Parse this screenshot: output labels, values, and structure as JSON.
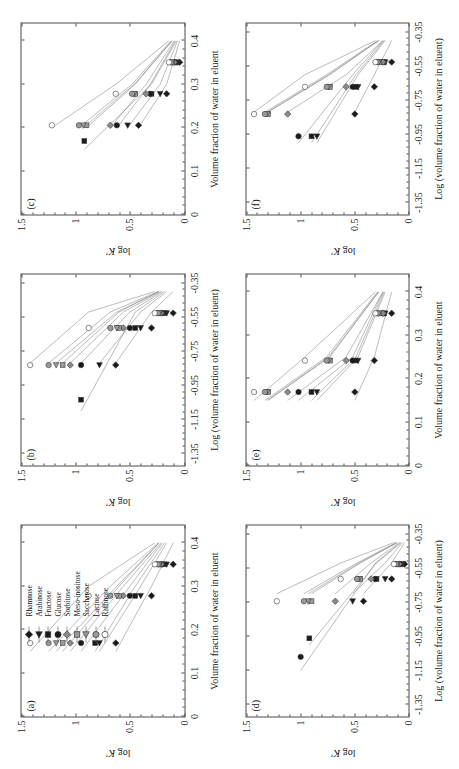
{
  "figure": {
    "ylabel": "log K'",
    "xlabel_linear": "Volume fraction of water in eluent",
    "xlabel_log": "Log (volume fraction of water in eluent)"
  },
  "legend": {
    "title": "",
    "items": [
      {
        "label": "Rhamnose",
        "marker": "diamond",
        "fill": "#1a1a1a"
      },
      {
        "label": "Arabinose",
        "marker": "triangle",
        "fill": "#1a1a1a"
      },
      {
        "label": "Fructose",
        "marker": "square",
        "fill": "#1a1a1a"
      },
      {
        "label": "Glucose",
        "marker": "circle",
        "fill": "#1a1a1a"
      },
      {
        "label": "Sorbitose",
        "marker": "diamond",
        "fill": "#8a8a8a"
      },
      {
        "label": "Meso-inositose",
        "marker": "square",
        "fill": "#9a9a9a"
      },
      {
        "label": "Saccharose",
        "marker": "triangle",
        "fill": "#9a9a9a"
      },
      {
        "label": "Lactose",
        "marker": "circle",
        "fill": "#9a9a9a"
      },
      {
        "label": "Raffinose",
        "marker": "circle",
        "fill": "#ffffff"
      }
    ]
  },
  "axes": {
    "y_ticks": [
      "0",
      "0.5",
      "1",
      "1.5"
    ],
    "y_values": [
      0,
      0.5,
      1,
      1.5
    ],
    "y_range": [
      0,
      1.5
    ],
    "x_ticks_linear": [
      "0",
      "0.1",
      "0.2",
      "0.3",
      "0.4"
    ],
    "x_values_linear": [
      0,
      0.1,
      0.2,
      0.3,
      0.4
    ],
    "x_range_linear": [
      0,
      0.44
    ],
    "x_ticks_log": [
      "-1.35",
      "-1.15",
      "-0.95",
      "-0.75",
      "-0.55",
      "-0.35"
    ],
    "x_values_log": [
      -1.35,
      -1.15,
      -0.95,
      -0.75,
      -0.55,
      -0.35
    ],
    "x_range_log": [
      -1.42,
      -0.3
    ]
  },
  "chart_data": [
    {
      "type": "scatter",
      "panel": "(a)",
      "title": "",
      "xlabel": "Volume fraction of water in eluent",
      "ylabel": "log K'",
      "xlim": [
        0,
        0.44
      ],
      "ylim": [
        0,
        1.5
      ],
      "grid": false,
      "legend_position": "inside-top-left",
      "series": [
        {
          "name": "Rhamnose",
          "marker": "diamond",
          "fill": "#1a1a1a",
          "x": [
            0.15,
            0.3,
            0.4
          ],
          "y": [
            0.63,
            0.3,
            0.1
          ]
        },
        {
          "name": "Arabinose",
          "marker": "triangle",
          "fill": "#1a1a1a",
          "x": [
            0.15,
            0.3,
            0.4
          ],
          "y": [
            0.78,
            0.4,
            0.16
          ]
        },
        {
          "name": "Fructose",
          "marker": "square",
          "fill": "#1a1a1a",
          "x": [
            0.15,
            0.3,
            0.4
          ],
          "y": [
            0.82,
            0.45,
            0.18
          ]
        },
        {
          "name": "Glucose",
          "marker": "circle",
          "fill": "#1a1a1a",
          "x": [
            0.15,
            0.3,
            0.4
          ],
          "y": [
            0.95,
            0.5,
            0.2
          ]
        },
        {
          "name": "Sorbitose",
          "marker": "diamond",
          "fill": "#8a8a8a",
          "x": [
            0.15,
            0.3,
            0.4
          ],
          "y": [
            1.05,
            0.56,
            0.21
          ]
        },
        {
          "name": "Meso-inositose",
          "marker": "square",
          "fill": "#9a9a9a",
          "x": [
            0.15,
            0.3,
            0.4
          ],
          "y": [
            1.12,
            0.6,
            0.23
          ]
        },
        {
          "name": "Saccharose",
          "marker": "triangle",
          "fill": "#9a9a9a",
          "x": [
            0.15,
            0.3,
            0.4
          ],
          "y": [
            1.18,
            0.62,
            0.23
          ]
        },
        {
          "name": "Lactose",
          "marker": "circle",
          "fill": "#9a9a9a",
          "x": [
            0.15,
            0.3,
            0.4
          ],
          "y": [
            1.25,
            0.68,
            0.24
          ]
        },
        {
          "name": "Raffinose",
          "marker": "circle",
          "fill": "#ffffff",
          "x": [
            0.15,
            0.3,
            0.4
          ],
          "y": [
            1.42,
            0.88,
            0.27
          ]
        }
      ]
    },
    {
      "type": "scatter",
      "panel": "(b)",
      "title": "",
      "xlabel": "Log (volume fraction of water in eluent)",
      "ylabel": "log K'",
      "xlim": [
        -1.42,
        -0.3
      ],
      "ylim": [
        0,
        1.5
      ],
      "grid": false,
      "legend_position": "none",
      "series": [
        {
          "name": "Rhamnose",
          "marker": "diamond",
          "fill": "#1a1a1a",
          "x": [
            -0.82,
            -0.52,
            -0.4
          ],
          "y": [
            0.63,
            0.3,
            0.1
          ]
        },
        {
          "name": "Arabinose",
          "marker": "triangle",
          "fill": "#1a1a1a",
          "x": [
            -0.82,
            -0.52,
            -0.4
          ],
          "y": [
            0.78,
            0.4,
            0.16
          ]
        },
        {
          "name": "Fructose",
          "marker": "square",
          "fill": "#1a1a1a",
          "x": [
            -1.1,
            -0.52,
            -0.4
          ],
          "y": [
            0.95,
            0.45,
            0.18
          ]
        },
        {
          "name": "Glucose",
          "marker": "circle",
          "fill": "#1a1a1a",
          "x": [
            -0.82,
            -0.52,
            -0.4
          ],
          "y": [
            0.95,
            0.5,
            0.2
          ]
        },
        {
          "name": "Sorbitose",
          "marker": "diamond",
          "fill": "#8a8a8a",
          "x": [
            -0.82,
            -0.52,
            -0.4
          ],
          "y": [
            1.05,
            0.56,
            0.21
          ]
        },
        {
          "name": "Meso-inositose",
          "marker": "square",
          "fill": "#9a9a9a",
          "x": [
            -0.82,
            -0.52,
            -0.4
          ],
          "y": [
            1.12,
            0.6,
            0.23
          ]
        },
        {
          "name": "Saccharose",
          "marker": "triangle",
          "fill": "#9a9a9a",
          "x": [
            -0.82,
            -0.52,
            -0.4
          ],
          "y": [
            1.18,
            0.62,
            0.23
          ]
        },
        {
          "name": "Lactose",
          "marker": "circle",
          "fill": "#9a9a9a",
          "x": [
            -0.82,
            -0.52,
            -0.4
          ],
          "y": [
            1.25,
            0.68,
            0.24
          ]
        },
        {
          "name": "Raffinose",
          "marker": "circle",
          "fill": "#ffffff",
          "x": [
            -0.82,
            -0.52,
            -0.4
          ],
          "y": [
            1.42,
            0.88,
            0.27
          ]
        }
      ]
    },
    {
      "type": "scatter",
      "panel": "(c)",
      "title": "",
      "xlabel": "Volume fraction of water in eluent",
      "ylabel": "log K'",
      "xlim": [
        0,
        0.44
      ],
      "ylim": [
        0,
        1.5
      ],
      "grid": false,
      "legend_position": "none",
      "series": [
        {
          "name": "Rhamnose",
          "marker": "diamond",
          "fill": "#1a1a1a",
          "x": [
            0.2,
            0.3,
            0.4
          ],
          "y": [
            0.42,
            0.16,
            0.04
          ]
        },
        {
          "name": "Arabinose",
          "marker": "triangle",
          "fill": "#1a1a1a",
          "x": [
            0.2,
            0.3,
            0.4
          ],
          "y": [
            0.52,
            0.22,
            0.06
          ]
        },
        {
          "name": "Fructose",
          "marker": "square",
          "fill": "#1a1a1a",
          "x": [
            0.15,
            0.3,
            0.4
          ],
          "y": [
            0.92,
            0.3,
            0.07
          ]
        },
        {
          "name": "Glucose",
          "marker": "circle",
          "fill": "#1a1a1a",
          "x": [
            0.2,
            0.3,
            0.4
          ],
          "y": [
            0.62,
            0.31,
            0.08
          ]
        },
        {
          "name": "Sorbitose",
          "marker": "diamond",
          "fill": "#8a8a8a",
          "x": [
            0.2,
            0.3,
            0.4
          ],
          "y": [
            0.68,
            0.35,
            0.09
          ]
        },
        {
          "name": "Meso-inositose",
          "marker": "square",
          "fill": "#9a9a9a",
          "x": [
            0.2,
            0.3,
            0.4
          ],
          "y": [
            0.9,
            0.45,
            0.11
          ]
        },
        {
          "name": "Saccharose",
          "marker": "triangle",
          "fill": "#9a9a9a",
          "x": [
            0.2,
            0.3,
            0.4
          ],
          "y": [
            0.93,
            0.46,
            0.11
          ]
        },
        {
          "name": "Lactose",
          "marker": "circle",
          "fill": "#9a9a9a",
          "x": [
            0.2,
            0.3,
            0.4
          ],
          "y": [
            0.97,
            0.48,
            0.12
          ]
        },
        {
          "name": "Raffinose",
          "marker": "circle",
          "fill": "#ffffff",
          "x": [
            0.2,
            0.3,
            0.4
          ],
          "y": [
            1.22,
            0.63,
            0.14
          ]
        }
      ]
    },
    {
      "type": "scatter",
      "panel": "(d)",
      "title": "",
      "xlabel": "Log (volume fraction of water in eluent)",
      "ylabel": "log K'",
      "xlim": [
        -1.42,
        -0.3
      ],
      "ylim": [
        0,
        1.5
      ],
      "grid": false,
      "legend_position": "none",
      "series": [
        {
          "name": "Rhamnose",
          "marker": "diamond",
          "fill": "#1a1a1a",
          "x": [
            -0.7,
            -0.52,
            -0.4
          ],
          "y": [
            0.42,
            0.16,
            0.04
          ]
        },
        {
          "name": "Arabinose",
          "marker": "triangle",
          "fill": "#1a1a1a",
          "x": [
            -0.7,
            -0.52,
            -0.4
          ],
          "y": [
            0.52,
            0.22,
            0.06
          ]
        },
        {
          "name": "Fructose",
          "marker": "square",
          "fill": "#1a1a1a",
          "x": [
            -1.0,
            -0.52,
            -0.4
          ],
          "y": [
            0.92,
            0.3,
            0.07
          ]
        },
        {
          "name": "Glucose",
          "marker": "circle",
          "fill": "#1a1a1a",
          "x": [
            -1.15,
            -0.52,
            -0.4
          ],
          "y": [
            1.0,
            0.31,
            0.08
          ]
        },
        {
          "name": "Sorbitose",
          "marker": "diamond",
          "fill": "#8a8a8a",
          "x": [
            -0.7,
            -0.52,
            -0.4
          ],
          "y": [
            0.68,
            0.35,
            0.09
          ]
        },
        {
          "name": "Meso-inositose",
          "marker": "square",
          "fill": "#9a9a9a",
          "x": [
            -0.7,
            -0.52,
            -0.4
          ],
          "y": [
            0.9,
            0.45,
            0.11
          ]
        },
        {
          "name": "Saccharose",
          "marker": "triangle",
          "fill": "#9a9a9a",
          "x": [
            -0.7,
            -0.52,
            -0.4
          ],
          "y": [
            0.93,
            0.46,
            0.11
          ]
        },
        {
          "name": "Lactose",
          "marker": "circle",
          "fill": "#9a9a9a",
          "x": [
            -0.7,
            -0.52,
            -0.4
          ],
          "y": [
            0.97,
            0.48,
            0.12
          ]
        },
        {
          "name": "Raffinose",
          "marker": "circle",
          "fill": "#ffffff",
          "x": [
            -0.7,
            -0.52,
            -0.4
          ],
          "y": [
            1.22,
            0.63,
            0.14
          ]
        }
      ]
    },
    {
      "type": "scatter",
      "panel": "(e)",
      "title": "",
      "xlabel": "Volume fraction of water in eluent",
      "ylabel": "log K'",
      "xlim": [
        0,
        0.44
      ],
      "ylim": [
        0,
        1.5
      ],
      "grid": false,
      "legend_position": "none",
      "series": [
        {
          "name": "Rhamnose",
          "marker": "diamond",
          "fill": "#1a1a1a",
          "x": [
            0.15,
            0.25,
            0.4
          ],
          "y": [
            0.5,
            0.32,
            0.16
          ]
        },
        {
          "name": "Arabinose",
          "marker": "triangle",
          "fill": "#1a1a1a",
          "x": [
            0.15,
            0.25,
            0.4
          ],
          "y": [
            0.85,
            0.47,
            0.22
          ]
        },
        {
          "name": "Fructose",
          "marker": "square",
          "fill": "#1a1a1a",
          "x": [
            0.15,
            0.25,
            0.4
          ],
          "y": [
            0.9,
            0.49,
            0.23
          ]
        },
        {
          "name": "Glucose",
          "marker": "circle",
          "fill": "#1a1a1a",
          "x": [
            0.15,
            0.25,
            0.4
          ],
          "y": [
            1.02,
            0.52,
            0.24
          ]
        },
        {
          "name": "Sorbitose",
          "marker": "diamond",
          "fill": "#8a8a8a",
          "x": [
            0.15,
            0.25,
            0.4
          ],
          "y": [
            1.12,
            0.58,
            0.24
          ]
        },
        {
          "name": "Meso-inositose",
          "marker": "square",
          "fill": "#9a9a9a",
          "x": [
            0.15,
            0.25,
            0.4
          ],
          "y": [
            1.3,
            0.73,
            0.28
          ]
        },
        {
          "name": "Saccharose",
          "marker": "triangle",
          "fill": "#9a9a9a",
          "x": [
            0.15,
            0.25,
            0.4
          ],
          "y": [
            1.31,
            0.74,
            0.28
          ]
        },
        {
          "name": "Lactose",
          "marker": "circle",
          "fill": "#9a9a9a",
          "x": [
            0.15,
            0.25,
            0.4
          ],
          "y": [
            1.33,
            0.76,
            0.29
          ]
        },
        {
          "name": "Raffinose",
          "marker": "circle",
          "fill": "#ffffff",
          "x": [
            0.15,
            0.25,
            0.4
          ],
          "y": [
            1.43,
            0.96,
            0.31
          ]
        }
      ]
    },
    {
      "type": "scatter",
      "panel": "(f)",
      "title": "",
      "xlabel": "Log (volume fraction of water in eluent)",
      "ylabel": "log K'",
      "xlim": [
        -1.42,
        -0.3
      ],
      "ylim": [
        0,
        1.5
      ],
      "grid": false,
      "legend_position": "none",
      "series": [
        {
          "name": "Rhamnose",
          "marker": "diamond",
          "fill": "#1a1a1a",
          "x": [
            -0.82,
            -0.6,
            -0.4
          ],
          "y": [
            0.5,
            0.32,
            0.16
          ]
        },
        {
          "name": "Arabinose",
          "marker": "triangle",
          "fill": "#1a1a1a",
          "x": [
            -1.0,
            -0.6,
            -0.4
          ],
          "y": [
            0.85,
            0.47,
            0.22
          ]
        },
        {
          "name": "Fructose",
          "marker": "square",
          "fill": "#1a1a1a",
          "x": [
            -1.0,
            -0.6,
            -0.4
          ],
          "y": [
            0.9,
            0.49,
            0.23
          ]
        },
        {
          "name": "Glucose",
          "marker": "circle",
          "fill": "#1a1a1a",
          "x": [
            -1.0,
            -0.6,
            -0.4
          ],
          "y": [
            1.02,
            0.52,
            0.24
          ]
        },
        {
          "name": "Sorbitose",
          "marker": "diamond",
          "fill": "#8a8a8a",
          "x": [
            -0.82,
            -0.6,
            -0.4
          ],
          "y": [
            1.12,
            0.58,
            0.24
          ]
        },
        {
          "name": "Meso-inositose",
          "marker": "square",
          "fill": "#9a9a9a",
          "x": [
            -0.82,
            -0.6,
            -0.4
          ],
          "y": [
            1.3,
            0.73,
            0.28
          ]
        },
        {
          "name": "Saccharose",
          "marker": "triangle",
          "fill": "#9a9a9a",
          "x": [
            -0.82,
            -0.6,
            -0.4
          ],
          "y": [
            1.31,
            0.74,
            0.28
          ]
        },
        {
          "name": "Lactose",
          "marker": "circle",
          "fill": "#9a9a9a",
          "x": [
            -0.82,
            -0.6,
            -0.4
          ],
          "y": [
            1.33,
            0.76,
            0.29
          ]
        },
        {
          "name": "Raffinose",
          "marker": "circle",
          "fill": "#ffffff",
          "x": [
            -0.82,
            -0.6,
            -0.4
          ],
          "y": [
            1.43,
            0.96,
            0.31
          ]
        }
      ]
    }
  ]
}
